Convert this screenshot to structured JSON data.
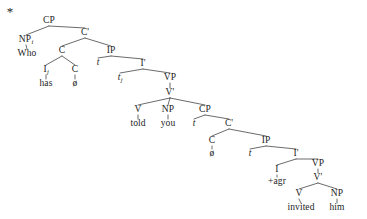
{
  "figure": {
    "type": "syntax-tree",
    "grammaticality_marker": "*",
    "background": "#ffffff",
    "ink": "#2b2b2b",
    "sentence": "Who has told you invited him",
    "width": 367,
    "height": 219
  },
  "nodes": [
    {
      "id": "star",
      "label": "*",
      "kind": "marker",
      "x": 10,
      "y": 11
    },
    {
      "id": "cp1",
      "label": "CP",
      "kind": "cat",
      "x": 49,
      "y": 21
    },
    {
      "id": "np1",
      "label": "NP",
      "sub": "i",
      "kind": "cat",
      "x": 26,
      "y": 40
    },
    {
      "id": "who",
      "label": "Who",
      "kind": "word",
      "x": 27,
      "y": 54
    },
    {
      "id": "cbar1",
      "label": "C'",
      "kind": "cat",
      "x": 85,
      "y": 33
    },
    {
      "id": "c1",
      "label": "C",
      "kind": "cat",
      "x": 62,
      "y": 51
    },
    {
      "id": "ip1",
      "label": "IP",
      "kind": "cat",
      "x": 111,
      "y": 51
    },
    {
      "id": "i1",
      "label": "I",
      "sub": "j",
      "kind": "cat",
      "x": 46,
      "y": 70
    },
    {
      "id": "has",
      "label": "has",
      "kind": "word",
      "x": 46,
      "y": 84
    },
    {
      "id": "c2",
      "label": "C",
      "kind": "cat",
      "x": 75,
      "y": 70
    },
    {
      "id": "null1",
      "label": "ø",
      "kind": "word",
      "x": 75,
      "y": 84
    },
    {
      "id": "t1",
      "label": "t",
      "kind": "trace",
      "x": 98,
      "y": 63
    },
    {
      "id": "ibar1",
      "label": "I'",
      "kind": "cat",
      "x": 143,
      "y": 64
    },
    {
      "id": "t2",
      "label": "t",
      "sub": "j",
      "kind": "trace",
      "x": 120,
      "y": 78
    },
    {
      "id": "vp1",
      "label": "VP",
      "kind": "cat",
      "x": 170,
      "y": 78
    },
    {
      "id": "vbar1",
      "label": "V'",
      "kind": "cat",
      "x": 170,
      "y": 93
    },
    {
      "id": "v1",
      "label": "V",
      "kind": "cat",
      "x": 138,
      "y": 110
    },
    {
      "id": "told",
      "label": "told",
      "kind": "word",
      "x": 138,
      "y": 124
    },
    {
      "id": "np2",
      "label": "NP",
      "kind": "cat",
      "x": 168,
      "y": 110
    },
    {
      "id": "you",
      "label": "you",
      "kind": "word",
      "x": 168,
      "y": 124
    },
    {
      "id": "cp2",
      "label": "CP",
      "kind": "cat",
      "x": 205,
      "y": 110
    },
    {
      "id": "t3",
      "label": "t",
      "kind": "trace",
      "x": 194,
      "y": 124
    },
    {
      "id": "cbar2",
      "label": "C'",
      "kind": "cat",
      "x": 229,
      "y": 124
    },
    {
      "id": "c3",
      "label": "C",
      "kind": "cat",
      "x": 212,
      "y": 141
    },
    {
      "id": "null2",
      "label": "ø",
      "kind": "word",
      "x": 212,
      "y": 154
    },
    {
      "id": "ip2",
      "label": "IP",
      "kind": "cat",
      "x": 266,
      "y": 141
    },
    {
      "id": "t4",
      "label": "t",
      "kind": "trace",
      "x": 250,
      "y": 154
    },
    {
      "id": "ibar2",
      "label": "I'",
      "kind": "cat",
      "x": 296,
      "y": 154
    },
    {
      "id": "i2",
      "label": "I",
      "kind": "cat",
      "x": 277,
      "y": 170
    },
    {
      "id": "agr",
      "label": "+agr",
      "kind": "word",
      "x": 277,
      "y": 182
    },
    {
      "id": "vp2",
      "label": "VP",
      "kind": "cat",
      "x": 318,
      "y": 164
    },
    {
      "id": "vbar2",
      "label": "V'",
      "kind": "cat",
      "x": 318,
      "y": 178
    },
    {
      "id": "v2",
      "label": "V",
      "kind": "cat",
      "x": 299,
      "y": 194
    },
    {
      "id": "invited",
      "label": "invited",
      "kind": "word",
      "x": 301,
      "y": 208
    },
    {
      "id": "np3",
      "label": "NP",
      "kind": "cat",
      "x": 337,
      "y": 194
    },
    {
      "id": "him",
      "label": "him",
      "kind": "word",
      "x": 337,
      "y": 208
    }
  ],
  "edges": [
    {
      "from": "cp1",
      "to": "np1",
      "kind": "branch"
    },
    {
      "from": "cp1",
      "to": "cbar1",
      "kind": "branch"
    },
    {
      "from": "np1",
      "to": "who",
      "kind": "stem"
    },
    {
      "from": "cbar1",
      "to": "c1",
      "kind": "branch"
    },
    {
      "from": "cbar1",
      "to": "ip1",
      "kind": "branch"
    },
    {
      "from": "c1",
      "to": "i1",
      "kind": "branch"
    },
    {
      "from": "c1",
      "to": "c2",
      "kind": "branch"
    },
    {
      "from": "i1",
      "to": "has",
      "kind": "stem"
    },
    {
      "from": "c2",
      "to": "null1",
      "kind": "stem"
    },
    {
      "from": "ip1",
      "to": "t1",
      "kind": "branch"
    },
    {
      "from": "ip1",
      "to": "ibar1",
      "kind": "branch"
    },
    {
      "from": "ibar1",
      "to": "t2",
      "kind": "branch"
    },
    {
      "from": "ibar1",
      "to": "vp1",
      "kind": "branch"
    },
    {
      "from": "vp1",
      "to": "vbar1",
      "kind": "stem"
    },
    {
      "from": "vbar1",
      "to": "v1",
      "kind": "branch"
    },
    {
      "from": "vbar1",
      "to": "np2",
      "kind": "branch"
    },
    {
      "from": "vbar1",
      "to": "cp2",
      "kind": "branch"
    },
    {
      "from": "v1",
      "to": "told",
      "kind": "stem"
    },
    {
      "from": "np2",
      "to": "you",
      "kind": "stem"
    },
    {
      "from": "cp2",
      "to": "t3",
      "kind": "branch"
    },
    {
      "from": "cp2",
      "to": "cbar2",
      "kind": "branch"
    },
    {
      "from": "cbar2",
      "to": "c3",
      "kind": "branch"
    },
    {
      "from": "cbar2",
      "to": "ip2",
      "kind": "branch"
    },
    {
      "from": "c3",
      "to": "null2",
      "kind": "stem"
    },
    {
      "from": "ip2",
      "to": "t4",
      "kind": "branch"
    },
    {
      "from": "ip2",
      "to": "ibar2",
      "kind": "branch"
    },
    {
      "from": "ibar2",
      "to": "i2",
      "kind": "branch"
    },
    {
      "from": "ibar2",
      "to": "vp2",
      "kind": "branch"
    },
    {
      "from": "i2",
      "to": "agr",
      "kind": "stem"
    },
    {
      "from": "vp2",
      "to": "vbar2",
      "kind": "stem"
    },
    {
      "from": "vbar2",
      "to": "v2",
      "kind": "branch"
    },
    {
      "from": "vbar2",
      "to": "np3",
      "kind": "branch"
    },
    {
      "from": "v2",
      "to": "invited",
      "kind": "stem"
    },
    {
      "from": "np3",
      "to": "him",
      "kind": "stem"
    }
  ]
}
